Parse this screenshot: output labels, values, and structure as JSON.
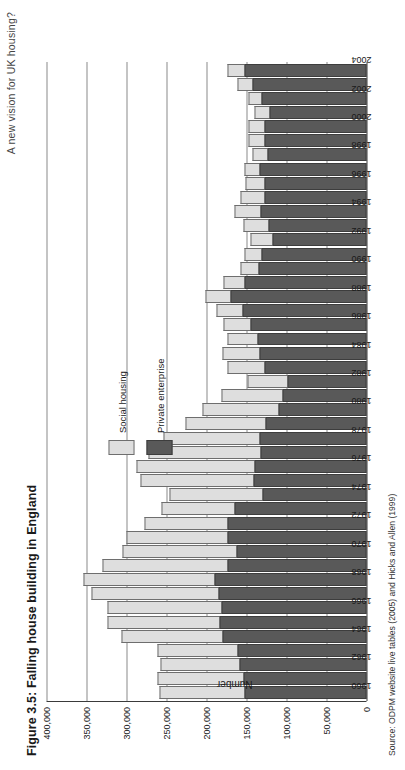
{
  "running_head": "A new vision for UK housing?",
  "figure": {
    "title": "Figure 3.5: Falling house building in England",
    "source": "Source: ODPM website live tables (2005) and Hicks and Allen (1999)"
  },
  "legend": {
    "position": "inside-top-left",
    "items": [
      {
        "label": "Social housing",
        "color": "#dedede",
        "name": "social"
      },
      {
        "label": "Private enterprise",
        "color": "#595959",
        "name": "private"
      }
    ]
  },
  "colors": {
    "social_housing": "#dedede",
    "private_enterprise": "#595959",
    "axis": "#3a3a3a",
    "gridline": "#8a8a8a"
  },
  "chart_data": {
    "type": "bar",
    "title": "Figure 3.5: Falling house building in England",
    "xlabel": "",
    "ylabel": "Number",
    "ylim": [
      0,
      400000
    ],
    "yticks": [
      "0",
      "50,000",
      "100,000",
      "150,000",
      "200,000",
      "250,000",
      "300,000",
      "350,000",
      "400,000"
    ],
    "ytick_values": [
      0,
      50000,
      100000,
      150000,
      200000,
      250000,
      300000,
      350000,
      400000
    ],
    "grid": true,
    "stacked": true,
    "legend_position": "upper left",
    "categories": [
      "1960",
      "1961",
      "1962",
      "1963",
      "1964",
      "1965",
      "1966",
      "1967",
      "1968",
      "1969",
      "1970",
      "1971",
      "1972",
      "1973",
      "1974",
      "1975",
      "1976",
      "1977",
      "1978",
      "1979",
      "1980",
      "1981",
      "1982",
      "1983",
      "1984",
      "1985",
      "1986",
      "1987",
      "1988",
      "1989",
      "1990",
      "1991",
      "1992",
      "1993",
      "1994",
      "1995",
      "1996",
      "1997",
      "1998",
      "1999",
      "2000",
      "2001",
      "2002",
      "2003",
      "2004"
    ],
    "xtick_labels": [
      "1960",
      "",
      "1962",
      "",
      "1964",
      "",
      "1966",
      "",
      "1968",
      "",
      "1970",
      "",
      "1972",
      "",
      "1974",
      "",
      "1976",
      "",
      "1978",
      "",
      "1980",
      "",
      "1982",
      "",
      "1984",
      "",
      "1986",
      "",
      "1988",
      "",
      "1990",
      "",
      "1992",
      "",
      "1994",
      "",
      "1996",
      "",
      "1998",
      "",
      "2000",
      "",
      "2002",
      "",
      "2004"
    ],
    "series": [
      {
        "name": "Private enterprise",
        "color": "#595959",
        "values": [
          152000,
          154000,
          159000,
          161000,
          180000,
          184000,
          181000,
          185000,
          190000,
          174000,
          162000,
          174000,
          174000,
          165000,
          130000,
          141000,
          140000,
          132000,
          134000,
          126000,
          110000,
          105000,
          99000,
          128000,
          134000,
          136000,
          145000,
          155000,
          170000,
          153000,
          135000,
          131000,
          117000,
          123000,
          132000,
          128000,
          127000,
          134000,
          124000,
          128000,
          128000,
          121000,
          131000,
          143000,
          153000
        ]
      },
      {
        "name": "Social housing",
        "color": "#dedede",
        "values": [
          107000,
          107000,
          99000,
          100000,
          126000,
          140000,
          143000,
          159000,
          164000,
          156000,
          143000,
          126000,
          104000,
          91000,
          116000,
          142000,
          148000,
          140000,
          120000,
          100000,
          95000,
          76000,
          50000,
          46000,
          46000,
          38000,
          34000,
          32000,
          31000,
          26000,
          23000,
          22000,
          28000,
          31000,
          33000,
          30000,
          24000,
          19000,
          18000,
          20000,
          19000,
          19000,
          17000,
          18000,
          21000
        ]
      }
    ]
  }
}
